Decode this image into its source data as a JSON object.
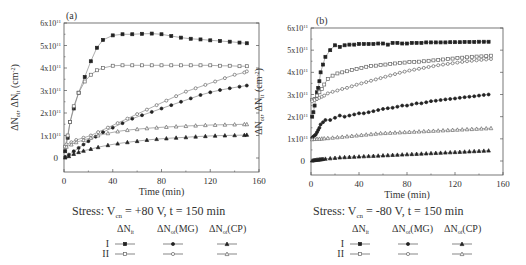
{
  "chart_data": [
    {
      "type": "scatter",
      "panel": "(a)",
      "title": "",
      "xlabel": "Time (min)",
      "ylabel": "ΔNot, ΔNit (cm⁻²)",
      "xlim": [
        0,
        160
      ],
      "ylim": [
        0,
        600000000000.0
      ],
      "xticks": [
        0,
        40,
        80,
        120,
        160
      ],
      "xtick_labels": [
        "0",
        "40",
        "80",
        "120",
        "160"
      ],
      "yticks": [
        0,
        100000000000.0,
        200000000000.0,
        300000000000.0,
        400000000000.0,
        500000000000.0,
        600000000000.0
      ],
      "ytick_labels": [
        "0",
        "1x10¹¹",
        "2x10¹¹",
        "3x10¹¹",
        "4x10¹¹",
        "5x10¹¹",
        "6x10¹¹"
      ],
      "stress_label": "Stress: Vcn = +80 V, t = 150 min",
      "legend_headers": [
        "ΔNit",
        "ΔNot(MG)",
        "ΔNot(CP)"
      ],
      "legend_rows": [
        "I",
        "II"
      ],
      "series": [
        {
          "name": "I ΔNit",
          "marker": "filled-square",
          "x": [
            1,
            3,
            5,
            8,
            12,
            17,
            22,
            27,
            32,
            40,
            48,
            56,
            64,
            72,
            80,
            88,
            96,
            104,
            112,
            120,
            128,
            136,
            144,
            150
          ],
          "y": [
            0.3,
            0.9,
            1.6,
            2.2,
            2.9,
            3.6,
            4.3,
            4.9,
            5.25,
            5.45,
            5.5,
            5.5,
            5.52,
            5.53,
            5.5,
            5.42,
            5.35,
            5.3,
            5.27,
            5.23,
            5.2,
            5.17,
            5.13,
            5.1
          ]
        },
        {
          "name": "II ΔNit",
          "marker": "open-square",
          "x": [
            1,
            3,
            5,
            8,
            12,
            17,
            22,
            27,
            32,
            40,
            48,
            56,
            64,
            72,
            80,
            88,
            96,
            104,
            112,
            120,
            128,
            136,
            144,
            150
          ],
          "y": [
            0.5,
            1.0,
            1.6,
            2.3,
            2.9,
            3.4,
            3.7,
            3.9,
            4.0,
            4.1,
            4.12,
            4.12,
            4.12,
            4.12,
            4.12,
            4.12,
            4.12,
            4.12,
            4.12,
            4.12,
            4.1,
            4.1,
            4.08,
            4.08
          ]
        },
        {
          "name": "II ΔNot(MG)",
          "marker": "open-circle",
          "x": [
            2,
            6,
            10,
            16,
            22,
            28,
            36,
            44,
            52,
            60,
            68,
            76,
            84,
            92,
            100,
            108,
            116,
            124,
            132,
            140,
            148,
            150
          ],
          "y": [
            0.6,
            0.7,
            0.8,
            0.9,
            1.0,
            1.15,
            1.35,
            1.55,
            1.75,
            1.95,
            2.15,
            2.35,
            2.55,
            2.75,
            2.95,
            3.1,
            3.25,
            3.4,
            3.55,
            3.7,
            3.8,
            3.85
          ]
        },
        {
          "name": "I ΔNot(MG)",
          "marker": "filled-circle",
          "x": [
            1,
            4,
            8,
            12,
            16,
            20,
            26,
            32,
            40,
            48,
            56,
            64,
            72,
            80,
            88,
            96,
            104,
            112,
            120,
            128,
            136,
            144,
            150
          ],
          "y": [
            0.05,
            0.15,
            0.3,
            0.45,
            0.6,
            0.75,
            0.95,
            1.15,
            1.35,
            1.55,
            1.75,
            1.9,
            2.05,
            2.2,
            2.35,
            2.5,
            2.65,
            2.8,
            2.92,
            3.02,
            3.1,
            3.17,
            3.22
          ]
        },
        {
          "name": "II ΔNot(CP)",
          "marker": "open-triangle",
          "x": [
            2,
            6,
            10,
            16,
            22,
            28,
            36,
            44,
            52,
            60,
            68,
            76,
            84,
            92,
            100,
            108,
            116,
            124,
            132,
            140,
            148,
            150
          ],
          "y": [
            0.5,
            0.6,
            0.7,
            0.8,
            0.9,
            1.0,
            1.1,
            1.18,
            1.24,
            1.28,
            1.32,
            1.35,
            1.38,
            1.4,
            1.42,
            1.44,
            1.46,
            1.47,
            1.48,
            1.49,
            1.5,
            1.5
          ]
        },
        {
          "name": "I ΔNot(CP)",
          "marker": "filled-triangle",
          "x": [
            1,
            4,
            8,
            12,
            16,
            22,
            28,
            36,
            44,
            52,
            60,
            68,
            76,
            84,
            92,
            100,
            108,
            116,
            124,
            132,
            140,
            148,
            150
          ],
          "y": [
            0.02,
            0.08,
            0.18,
            0.26,
            0.32,
            0.4,
            0.48,
            0.57,
            0.64,
            0.7,
            0.75,
            0.8,
            0.84,
            0.87,
            0.9,
            0.92,
            0.95,
            0.97,
            0.99,
            1.0,
            1.01,
            1.02,
            1.03
          ]
        }
      ]
    },
    {
      "type": "scatter",
      "panel": "(b)",
      "title": "",
      "xlabel": "Time (min)",
      "ylabel": "ΔNot, ΔNit (cm⁻²)",
      "xlim": [
        0,
        160
      ],
      "ylim": [
        0,
        600000000000.0
      ],
      "xticks": [
        0,
        40,
        80,
        120,
        160
      ],
      "xtick_labels": [
        "0",
        "40",
        "80",
        "120",
        "160"
      ],
      "yticks": [
        0,
        100000000000.0,
        200000000000.0,
        300000000000.0,
        400000000000.0,
        500000000000.0,
        600000000000.0
      ],
      "ytick_labels": [
        "0",
        "1x10¹¹",
        "2x10¹¹",
        "3x10¹¹",
        "4x10¹¹",
        "5x10¹¹",
        "6x10¹¹"
      ],
      "stress_label": "Stress: Vcn = -80 V, t = 150 min",
      "legend_headers": [
        "ΔNit",
        "ΔNot(MG)",
        "ΔNot(CP)"
      ],
      "legend_rows": [
        "I",
        "II"
      ],
      "series": [
        {
          "name": "I ΔNit",
          "marker": "filled-square",
          "x": [
            1,
            2,
            3,
            4,
            5,
            6,
            7,
            8,
            10,
            12,
            16,
            20,
            24,
            28,
            32,
            36,
            40,
            44,
            48,
            52,
            56,
            60,
            64,
            68,
            72,
            76,
            80,
            84,
            88,
            92,
            96,
            100,
            104,
            108,
            112,
            116,
            120,
            124,
            128,
            132,
            136,
            140,
            144,
            148
          ],
          "y": [
            2.0,
            2.2,
            2.5,
            2.8,
            3.1,
            3.3,
            3.6,
            4.0,
            4.35,
            4.7,
            5.0,
            5.22,
            5.15,
            5.22,
            5.25,
            5.25,
            5.28,
            5.28,
            5.28,
            5.28,
            5.3,
            5.3,
            5.25,
            5.33,
            5.33,
            5.3,
            5.3,
            5.33,
            5.33,
            5.33,
            5.35,
            5.35,
            5.35,
            5.35,
            5.35,
            5.36,
            5.36,
            5.36,
            5.37,
            5.37,
            5.37,
            5.38,
            5.38,
            5.38
          ]
        },
        {
          "name": "II ΔNit",
          "marker": "open-square",
          "x": [
            1,
            3,
            5,
            7,
            9,
            11,
            14,
            18,
            22,
            26,
            30,
            34,
            38,
            42,
            46,
            50,
            54,
            58,
            62,
            66,
            70,
            74,
            78,
            82,
            86,
            90,
            94,
            98,
            102,
            106,
            110,
            114,
            118,
            122,
            126,
            130,
            134,
            138,
            142,
            146,
            150
          ],
          "y": [
            2.75,
            2.8,
            2.95,
            3.1,
            3.25,
            3.45,
            3.7,
            3.85,
            3.95,
            4.0,
            4.05,
            4.1,
            4.15,
            4.2,
            4.25,
            4.28,
            4.3,
            4.33,
            4.35,
            4.38,
            4.4,
            4.42,
            4.44,
            4.46,
            4.47,
            4.48,
            4.5,
            4.52,
            4.54,
            4.56,
            4.58,
            4.6,
            4.62,
            4.64,
            4.66,
            4.68,
            4.7,
            4.71,
            4.72,
            4.73,
            4.75
          ]
        },
        {
          "name": "II ΔNot(MG)",
          "marker": "open-circle",
          "x": [
            1,
            3,
            5,
            7,
            9,
            11,
            14,
            18,
            22,
            26,
            30,
            34,
            38,
            42,
            46,
            50,
            54,
            58,
            62,
            66,
            70,
            74,
            78,
            82,
            86,
            90,
            94,
            98,
            102,
            106,
            110,
            114,
            118,
            122,
            126,
            130,
            134,
            138,
            142,
            146,
            150
          ],
          "y": [
            2.7,
            2.75,
            2.8,
            2.85,
            2.9,
            2.95,
            3.05,
            3.12,
            3.18,
            3.25,
            3.3,
            3.37,
            3.44,
            3.5,
            3.56,
            3.62,
            3.68,
            3.74,
            3.8,
            3.86,
            3.92,
            3.98,
            4.03,
            4.08,
            4.12,
            4.16,
            4.2,
            4.24,
            4.28,
            4.32,
            4.35,
            4.38,
            4.41,
            4.44,
            4.47,
            4.5,
            4.52,
            4.54,
            4.56,
            4.58,
            4.6
          ]
        },
        {
          "name": "I ΔNot(MG)",
          "marker": "filled-circle",
          "x": [
            1,
            2,
            3,
            4,
            5,
            6,
            7,
            8,
            10,
            12,
            16,
            20,
            24,
            28,
            32,
            36,
            40,
            44,
            48,
            52,
            56,
            60,
            64,
            68,
            72,
            76,
            80,
            84,
            88,
            92,
            96,
            100,
            104,
            108,
            112,
            116,
            120,
            124,
            128,
            132,
            136,
            140,
            144,
            148
          ],
          "y": [
            1.05,
            1.1,
            1.15,
            1.2,
            1.3,
            1.4,
            1.5,
            1.65,
            1.75,
            1.85,
            1.85,
            1.95,
            2.05,
            2.0,
            2.05,
            2.1,
            2.15,
            2.15,
            2.2,
            2.25,
            2.3,
            2.35,
            2.38,
            2.4,
            2.45,
            2.5,
            2.5,
            2.55,
            2.6,
            2.6,
            2.65,
            2.7,
            2.72,
            2.75,
            2.78,
            2.8,
            2.82,
            2.85,
            2.88,
            2.9,
            2.92,
            2.95,
            2.98,
            3.0
          ]
        },
        {
          "name": "II ΔNot(CP)",
          "marker": "open-triangle",
          "x": [
            1,
            3,
            5,
            7,
            9,
            11,
            14,
            18,
            22,
            26,
            30,
            34,
            38,
            42,
            46,
            50,
            54,
            58,
            62,
            66,
            70,
            74,
            78,
            82,
            86,
            90,
            94,
            98,
            102,
            106,
            110,
            114,
            118,
            122,
            126,
            130,
            134,
            138,
            142,
            146,
            150
          ],
          "y": [
            0.98,
            0.99,
            1.0,
            1.0,
            1.01,
            1.02,
            1.03,
            1.05,
            1.07,
            1.09,
            1.11,
            1.13,
            1.15,
            1.17,
            1.19,
            1.21,
            1.23,
            1.25,
            1.26,
            1.27,
            1.28,
            1.29,
            1.3,
            1.31,
            1.32,
            1.33,
            1.34,
            1.35,
            1.36,
            1.37,
            1.38,
            1.39,
            1.4,
            1.41,
            1.42,
            1.43,
            1.44,
            1.45,
            1.46,
            1.47,
            1.48
          ]
        },
        {
          "name": "I ΔNot(CP)",
          "marker": "filled-triangle",
          "x": [
            1,
            2,
            3,
            4,
            5,
            6,
            7,
            8,
            9,
            10,
            12,
            16,
            20,
            24,
            28,
            32,
            36,
            40,
            44,
            48,
            52,
            56,
            60,
            64,
            68,
            72,
            76,
            80,
            84,
            88,
            92,
            96,
            100,
            104,
            108,
            112,
            116,
            120,
            124,
            128,
            132,
            136,
            140,
            144,
            148
          ],
          "y": [
            0.02,
            0.03,
            0.04,
            0.05,
            0.06,
            0.06,
            0.07,
            0.07,
            0.08,
            0.09,
            0.1,
            0.12,
            0.14,
            0.16,
            0.17,
            0.18,
            0.19,
            0.2,
            0.21,
            0.22,
            0.23,
            0.24,
            0.25,
            0.26,
            0.27,
            0.28,
            0.29,
            0.3,
            0.31,
            0.32,
            0.33,
            0.34,
            0.35,
            0.36,
            0.37,
            0.38,
            0.39,
            0.4,
            0.41,
            0.42,
            0.43,
            0.44,
            0.45,
            0.46,
            0.47
          ]
        }
      ]
    }
  ],
  "panels": [
    {
      "label": "(a)",
      "xlabel": "Time (min)",
      "ylabel_main": "ΔN",
      "stress": {
        "prefix": "Stress: V",
        "sub": "cn",
        "suffix": " = +80 V, t = 150 min"
      },
      "headers": [
        "ΔN",
        "ΔN",
        "ΔN"
      ],
      "header_subs": [
        "it",
        "ot",
        "ot"
      ],
      "header_suffix": [
        "",
        "(MG)",
        "(CP)"
      ],
      "rows": [
        "I",
        "II"
      ]
    },
    {
      "label": "(b)",
      "xlabel": "Time (min)",
      "ylabel_main": "ΔN",
      "stress": {
        "prefix": "Stress: V",
        "sub": "cn",
        "suffix": " = -80 V, t = 150 min"
      },
      "headers": [
        "ΔN",
        "ΔN",
        "ΔN"
      ],
      "header_subs": [
        "it",
        "ot",
        "ot"
      ],
      "header_suffix": [
        "",
        "(MG)",
        "(CP)"
      ],
      "rows": [
        "I",
        "II"
      ]
    }
  ],
  "colors": {
    "ink": "#222222",
    "axis": "#555555",
    "line": "#666666"
  }
}
